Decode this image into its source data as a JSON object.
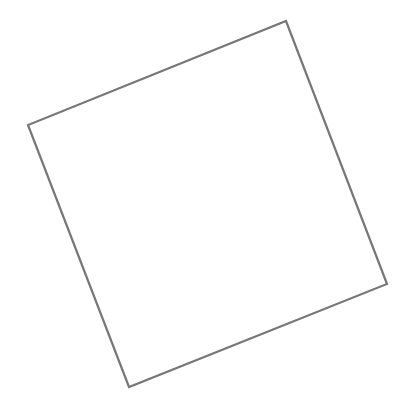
{
  "canvas": {
    "width": 415,
    "height": 409,
    "background": "#ffffff"
  },
  "shape": {
    "type": "rotated-square",
    "points": [
      [
        286,
        21
      ],
      [
        387,
        284
      ],
      [
        129,
        387
      ],
      [
        28,
        125
      ]
    ],
    "stroke": "#777777",
    "stroke_width": 2.2,
    "fill": "#ffffff"
  }
}
